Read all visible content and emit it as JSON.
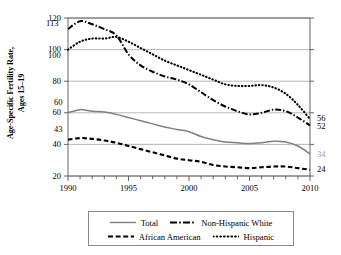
{
  "chart_data": {
    "type": "line",
    "title": "",
    "xlabel": "",
    "ylabel": "Age-Specific Fertility Rate, Ages 15–19",
    "ylabel_line1": "Age-Specific Fertility Rate,",
    "ylabel_line2": "Ages 15–19",
    "xlim": [
      1990,
      2010
    ],
    "ylim": [
      20,
      120
    ],
    "yticks": [
      20,
      40,
      60,
      80,
      100,
      120
    ],
    "ytick_labels": [
      "20",
      "40",
      "60",
      "80",
      "100",
      "120"
    ],
    "xticks": [
      1990,
      1995,
      2000,
      2005,
      2010
    ],
    "xtick_labels": [
      "1990",
      "1995",
      "2000",
      "2005",
      "2010"
    ],
    "x_minor_tick_interval": 1,
    "grid": "horizontal",
    "legend_position": "bottom",
    "x": [
      1990,
      1991,
      1992,
      1993,
      1994,
      1995,
      1996,
      1997,
      1998,
      1999,
      2000,
      2001,
      2002,
      2003,
      2004,
      2005,
      2006,
      2007,
      2008,
      2009,
      2010
    ],
    "series": [
      {
        "name": "Total",
        "style": "solid",
        "color": "#808080",
        "start_label": "60",
        "end_label": "34",
        "values": [
          60,
          62,
          61,
          60.5,
          59,
          57,
          55,
          53,
          51,
          49.5,
          48,
          45,
          43,
          41.5,
          41,
          40.5,
          41,
          42,
          41.5,
          39,
          34
        ]
      },
      {
        "name": "Non-Hispanic White",
        "style": "dashdot",
        "color": "#000000",
        "start_label": "113",
        "end_label": "52",
        "values": [
          113,
          118,
          116,
          113,
          109,
          97,
          90,
          86,
          83,
          81,
          78,
          73,
          68,
          64,
          61,
          59,
          60,
          62,
          61,
          57,
          52
        ]
      },
      {
        "name": "African American",
        "style": "dashed",
        "color": "#000000",
        "start_label": "43",
        "end_label": "24",
        "values": [
          43,
          44,
          43.5,
          42.5,
          41,
          39,
          37,
          35,
          33,
          31,
          30,
          29,
          27,
          26,
          25.5,
          25,
          25.5,
          26,
          26,
          25,
          24
        ]
      },
      {
        "name": "Hispanic",
        "style": "dotted",
        "color": "#000000",
        "start_label": "100",
        "end_label": "56",
        "values": [
          100,
          105,
          107,
          107,
          108,
          105,
          101,
          97,
          93,
          90,
          87,
          84,
          81,
          78,
          77,
          77,
          77.5,
          76,
          72,
          65,
          56
        ]
      }
    ],
    "start_annotations": [
      {
        "label": "113",
        "value": 113
      },
      {
        "label": "100",
        "value": 100
      },
      {
        "label": "60",
        "value": 60
      },
      {
        "label": "43",
        "value": 43
      }
    ],
    "end_annotations": [
      {
        "label": "56",
        "value": 56
      },
      {
        "label": "52",
        "value": 52
      },
      {
        "label": "34",
        "value": 34
      },
      {
        "label": "24",
        "value": 24
      }
    ]
  },
  "legend": {
    "entries": [
      {
        "label": "Total",
        "style": "solid",
        "color": "#808080"
      },
      {
        "label": "Non-Hispanic White",
        "style": "dashdot",
        "color": "#000000"
      },
      {
        "label": "African American",
        "style": "dashed",
        "color": "#000000"
      },
      {
        "label": "Hispanic",
        "style": "dotted",
        "color": "#000000"
      }
    ]
  }
}
